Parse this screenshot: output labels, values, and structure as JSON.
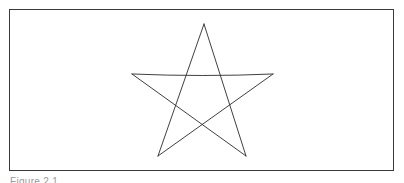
{
  "figure": {
    "caption": "Figure 2.1",
    "stroke_color": "#2a2a2a",
    "frame_color": "#3a3a3a",
    "shape": "five-pointed star (pentagram)",
    "vertices": {
      "top": [
        204,
        24
      ],
      "left": [
        132,
        74
      ],
      "right": [
        273,
        74
      ],
      "bottom_left": [
        158,
        156
      ],
      "bottom_right": [
        246,
        156
      ]
    }
  }
}
